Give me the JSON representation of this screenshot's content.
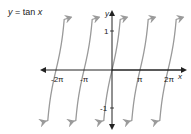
{
  "title": {
    "prefix": "y",
    "eq": " = tan ",
    "var": "x"
  },
  "axes": {
    "xlabel": "x",
    "ylabel": "y"
  },
  "ticks": {
    "x": [
      "-2π",
      "-π",
      "π",
      "2π"
    ],
    "y": [
      "1",
      "-1"
    ]
  },
  "colors": {
    "axis": "#222222",
    "curve": "#9a9a9a"
  },
  "chart_data": {
    "type": "line",
    "title": "y = tan x",
    "xlabel": "x",
    "ylabel": "y",
    "function": "tan(x)",
    "xlim": [
      -2.75,
      2.6
    ],
    "xlim_units": "π",
    "ylim": [
      -1.4,
      1.4
    ],
    "x_ticks": [
      "-2π",
      "-π",
      "π",
      "2π"
    ],
    "y_ticks": [
      1,
      -1
    ],
    "asymptotes": [
      "-5π/2",
      "-3π/2",
      "-π/2",
      "π/2",
      "3π/2",
      "5π/2"
    ],
    "branches_centers": [
      "-2π",
      "-π",
      "0",
      "π",
      "2π"
    ],
    "series": [
      {
        "name": "tan x",
        "x": [
          "-π/4",
          "0",
          "π/4"
        ],
        "y": [
          -1,
          0,
          1
        ]
      }
    ],
    "grid": false,
    "legend": "none"
  }
}
